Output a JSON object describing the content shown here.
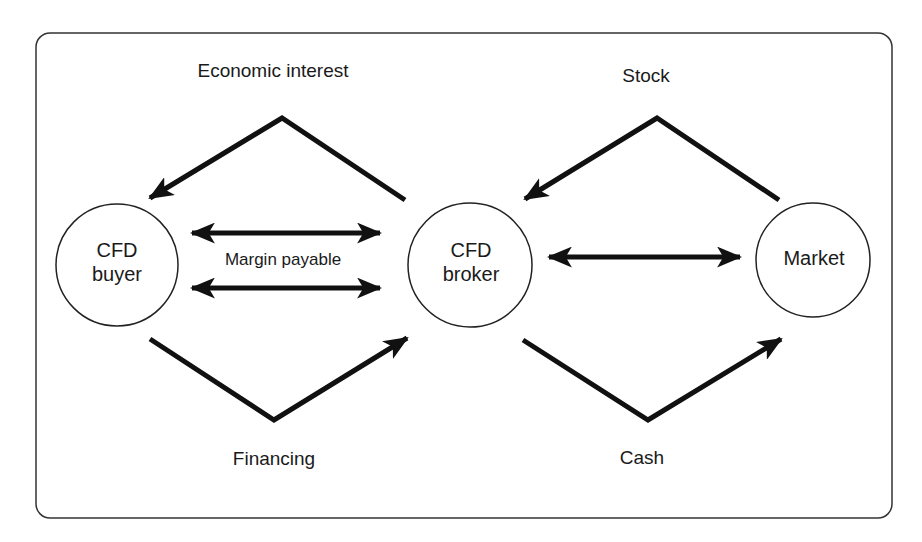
{
  "diagram": {
    "nodes": {
      "buyer": {
        "line1": "CFD",
        "line2": "buyer"
      },
      "broker": {
        "line1": "CFD",
        "line2": "broker"
      },
      "market": {
        "label": "Market"
      }
    },
    "flows": {
      "economic_interest": "Economic interest",
      "stock": "Stock",
      "financing": "Financing",
      "cash": "Cash",
      "margin": "Margin payable"
    },
    "colors": {
      "stroke": "#111111",
      "frame": "#333333",
      "background": "#ffffff"
    }
  }
}
